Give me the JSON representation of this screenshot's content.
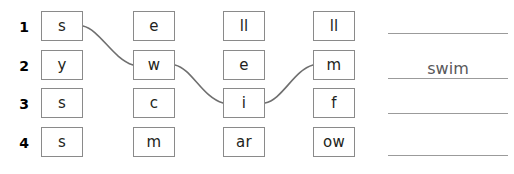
{
  "worksheet": {
    "title": "word-building-grid-worksheet",
    "grid": {
      "rows": [
        {
          "number": "1",
          "cells": [
            "s",
            "e",
            "ll",
            "ll"
          ]
        },
        {
          "number": "2",
          "cells": [
            "y",
            "w",
            "e",
            "m"
          ]
        },
        {
          "number": "3",
          "cells": [
            "s",
            "c",
            "i",
            "f"
          ]
        },
        {
          "number": "4",
          "cells": [
            "s",
            "m",
            "ar",
            "ow"
          ]
        }
      ]
    },
    "connectors": [
      {
        "name": "connector-s-to-w",
        "from": "row1-col1",
        "to": "row2-col2"
      },
      {
        "name": "connector-w-to-i",
        "from": "row2-col2",
        "to": "row3-col3"
      },
      {
        "name": "connector-i-to-m",
        "from": "row3-col3",
        "to": "row2-col4"
      }
    ],
    "answers": [
      {
        "name": "answer-line-1",
        "value": ""
      },
      {
        "name": "answer-line-2",
        "value": "swim"
      },
      {
        "name": "answer-line-3",
        "value": ""
      },
      {
        "name": "answer-line-4",
        "value": ""
      }
    ],
    "colors": {
      "tile_border": "#8a8a8a",
      "text": "#231f20",
      "answer_rule": "#9b9b9b",
      "answer_text": "#58585a",
      "connector_stroke": "#6f6f6f",
      "background": "#ffffff"
    }
  }
}
